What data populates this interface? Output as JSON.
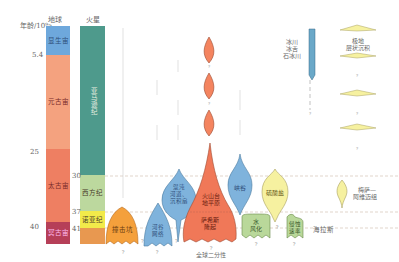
{
  "axis": {
    "title": "年龄/10⁹a",
    "ticks": [
      "5.4",
      "25",
      "40"
    ]
  },
  "earth": {
    "header": "地球",
    "eons": [
      {
        "name": "显生宙",
        "color": "#6ea8dc"
      },
      {
        "name": "元古宙",
        "color": "#f4a27f"
      },
      {
        "name": "太古宙",
        "color": "#ee7f62"
      },
      {
        "name": "冥古宙",
        "color": "#b63f58"
      }
    ]
  },
  "mars": {
    "header": "火星",
    "periods": [
      {
        "name": "亚马逊纪",
        "color": "#4e9a8c",
        "boundary": ""
      },
      {
        "name": "西方纪",
        "color": "#bcd89e",
        "boundary": "30"
      },
      {
        "name": "诺亚纪",
        "color": "#f2ea4a",
        "boundary": "37"
      },
      {
        "name": "",
        "color": "#e89850",
        "boundary": "41"
      }
    ]
  },
  "features": [
    {
      "name": "撞击坑",
      "color": "#f4a03c"
    },
    {
      "name": "河谷网络",
      "color": "#7fb3dc"
    },
    {
      "name": "混沌地形、河道、沉积扇",
      "color": "#7fb3dc"
    },
    {
      "name": "萨希斯隆起",
      "color": "#f07858"
    },
    {
      "name": "火山台地平原",
      "color": "#f07858"
    },
    {
      "name": "峡谷",
      "color": "#7fb3dc"
    },
    {
      "name": "硫酸盐",
      "color": "#f6f1a0"
    },
    {
      "name": "水风化",
      "color": "#b9d89a"
    },
    {
      "name": "侵蚀速率",
      "color": "#b9d89a"
    },
    {
      "name": "冰川冰舌石冰川",
      "color": "#6aa8c8"
    },
    {
      "name": "极地层状沉积",
      "color": "#f6f1a0"
    },
    {
      "name": "梅萨—阿维迈组",
      "color": "#f6f1a0"
    }
  ],
  "labels": {
    "dichotomy": "全球二分性",
    "hellas": "海拉斯",
    "question": "?",
    "glacier": [
      "冰川",
      "冰舌",
      "石冰川"
    ],
    "polar": [
      "极地",
      "层状沉积"
    ],
    "medusae": [
      "梅萨—",
      "阿维迈组"
    ],
    "crater": "撞击坑",
    "valley": [
      "河谷",
      "网络"
    ],
    "chaos": [
      "混沌",
      "河道、",
      "沉积扇"
    ],
    "volcanic": [
      "火山台",
      "地平原"
    ],
    "tharsis": [
      "萨希斯",
      "隆起"
    ],
    "canyon": "峡谷",
    "sulfate": "硫酸盐",
    "weathering": [
      "水",
      "风化"
    ],
    "erosion": [
      "侵蚀",
      "速率"
    ]
  }
}
